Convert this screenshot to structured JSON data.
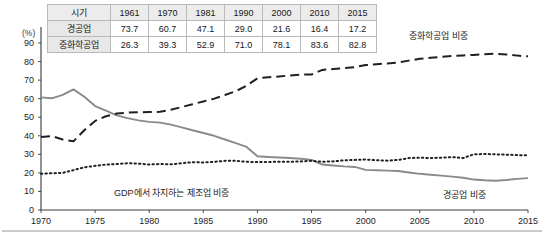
{
  "chart_data": {
    "type": "line",
    "title": "",
    "xlabel": "",
    "ylabel": "(%)",
    "xlim": [
      1970,
      2015
    ],
    "ylim": [
      0,
      90
    ],
    "grid": false,
    "legend_position": "inline-annotations",
    "x_ticks": [
      "1970",
      "1975",
      "1980",
      "1985",
      "1990",
      "1995",
      "2000",
      "2005",
      "2010",
      "2015"
    ],
    "y_ticks": [
      "0",
      "10",
      "20",
      "30",
      "40",
      "50",
      "60",
      "70",
      "80",
      "90"
    ],
    "series": [
      {
        "name": "경공업 비중",
        "style": "solid",
        "color": "#8a8a8a",
        "x": [
          1970,
          1971,
          1972,
          1973,
          1974,
          1975,
          1976,
          1977,
          1978,
          1979,
          1980,
          1981,
          1982,
          1983,
          1984,
          1985,
          1986,
          1987,
          1988,
          1989,
          1990,
          1991,
          1992,
          1993,
          1994,
          1995,
          1996,
          1997,
          1998,
          1999,
          2000,
          2001,
          2002,
          2003,
          2004,
          2005,
          2006,
          2007,
          2008,
          2009,
          2010,
          2011,
          2012,
          2013,
          2014,
          2015
        ],
        "values": [
          60.7,
          60.2,
          62.0,
          65.0,
          61.0,
          56.0,
          53.5,
          51.0,
          49.5,
          48.3,
          47.5,
          47.1,
          46.0,
          44.5,
          43.0,
          41.5,
          40.0,
          38.0,
          36.0,
          34.0,
          29.0,
          28.6,
          28.3,
          28.0,
          27.6,
          27.0,
          24.5,
          24.0,
          23.5,
          23.2,
          21.6,
          21.4,
          21.2,
          21.0,
          20.2,
          19.5,
          19.0,
          18.5,
          18.0,
          17.4,
          16.4,
          16.0,
          15.8,
          16.2,
          16.8,
          17.2
        ]
      },
      {
        "name": "중화학공업 비중",
        "style": "dashed",
        "color": "#202020",
        "x": [
          1970,
          1971,
          1972,
          1973,
          1974,
          1975,
          1976,
          1977,
          1978,
          1979,
          1980,
          1981,
          1982,
          1983,
          1984,
          1985,
          1986,
          1987,
          1988,
          1989,
          1990,
          1991,
          1992,
          1993,
          1994,
          1995,
          1996,
          1997,
          1998,
          1999,
          2000,
          2001,
          2002,
          2003,
          2004,
          2005,
          2006,
          2007,
          2008,
          2009,
          2010,
          2011,
          2012,
          2013,
          2014,
          2015
        ],
        "values": [
          39.3,
          39.8,
          38.0,
          37.0,
          43.0,
          48.0,
          50.5,
          52.0,
          52.5,
          52.7,
          52.8,
          52.9,
          54.0,
          55.5,
          57.0,
          58.5,
          60.0,
          62.0,
          64.0,
          67.0,
          71.0,
          71.5,
          72.0,
          72.5,
          73.0,
          73.0,
          75.5,
          76.0,
          76.5,
          77.0,
          78.1,
          78.6,
          79.0,
          79.5,
          80.5,
          81.5,
          82.0,
          82.5,
          83.0,
          83.3,
          83.6,
          84.0,
          84.2,
          83.8,
          83.2,
          82.8
        ]
      },
      {
        "name": "GDP에서 차지하는 제조업 비중",
        "style": "dotted",
        "color": "#202020",
        "x": [
          1970,
          1971,
          1972,
          1973,
          1974,
          1975,
          1976,
          1977,
          1978,
          1979,
          1980,
          1981,
          1982,
          1983,
          1984,
          1985,
          1986,
          1987,
          1988,
          1989,
          1990,
          1991,
          1992,
          1993,
          1994,
          1995,
          1996,
          1997,
          1998,
          1999,
          2000,
          2001,
          2002,
          2003,
          2004,
          2005,
          2006,
          2007,
          2008,
          2009,
          2010,
          2011,
          2012,
          2013,
          2014,
          2015
        ],
        "values": [
          19.5,
          19.8,
          20.0,
          21.5,
          23.0,
          23.8,
          24.5,
          24.8,
          25.2,
          25.0,
          24.5,
          24.8,
          24.6,
          25.2,
          25.8,
          25.6,
          26.0,
          26.5,
          26.5,
          26.0,
          25.8,
          25.9,
          26.0,
          26.0,
          26.2,
          26.5,
          26.0,
          26.2,
          26.8,
          27.0,
          27.2,
          26.8,
          26.6,
          27.0,
          28.0,
          28.2,
          28.0,
          28.2,
          28.5,
          28.0,
          30.0,
          30.2,
          30.0,
          29.8,
          29.6,
          29.5
        ]
      }
    ],
    "annotations": [
      {
        "text": "중화학공업 비중",
        "series": "중화학공업 비중"
      },
      {
        "text": "GDP에서 차지하는 제조업 비중",
        "series": "GDP에서 차지하는 제조업 비중"
      },
      {
        "text": "경공업 비중",
        "series": "경공업 비중"
      }
    ]
  },
  "table": {
    "header": [
      "시기",
      "1961",
      "1970",
      "1981",
      "1990",
      "2000",
      "2010",
      "2015"
    ],
    "rows": [
      {
        "label": "경공업",
        "values": [
          "73.7",
          "60.7",
          "47.1",
          "29.0",
          "21.6",
          "16.4",
          "17.2"
        ]
      },
      {
        "label": "중화학공업",
        "values": [
          "26.3",
          "39.3",
          "52.9",
          "71.0",
          "78.1",
          "83.6",
          "82.8"
        ]
      }
    ]
  },
  "axis": {
    "unit_label": "(%)"
  }
}
